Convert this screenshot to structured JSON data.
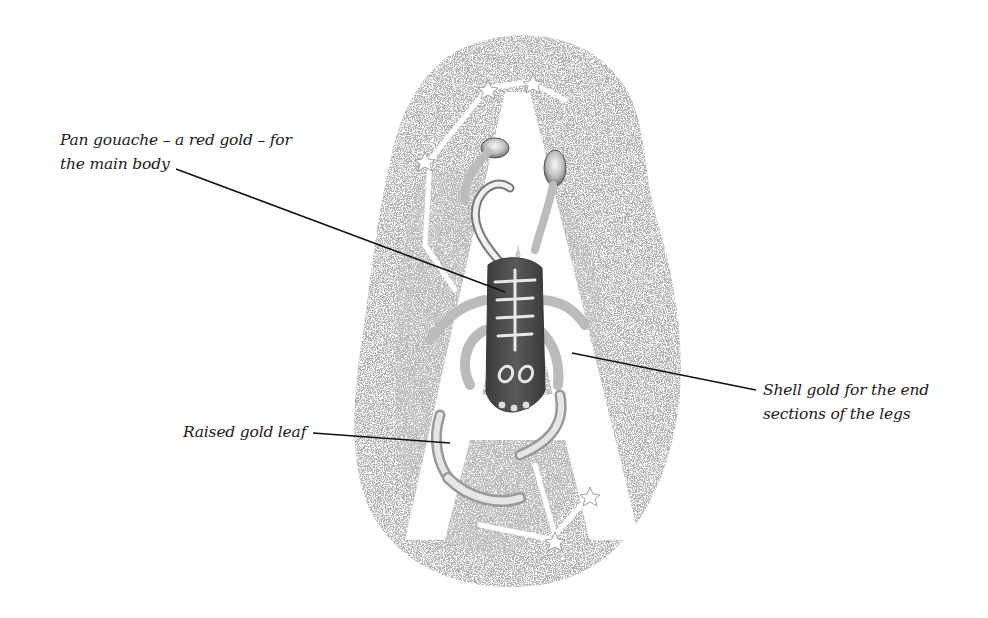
{
  "illustration": {
    "subject": "Illuminated letter A with raised gilded scorpion and constellation stars",
    "letter": "A",
    "colors": {
      "background": "#ffffff",
      "speckle": "#9a9a9a",
      "speckle_dark": "#6e6e6e",
      "body": "#4a4a4a",
      "highlight": "#f2f2f2",
      "leader_line": "#111111"
    }
  },
  "annotations": [
    {
      "id": "main-body",
      "lines": [
        "Pan gouache – a red gold – for",
        "the main body"
      ]
    },
    {
      "id": "leg-ends",
      "lines": [
        "Shell gold for the end",
        "sections of the legs"
      ]
    },
    {
      "id": "raised-leaf",
      "lines": [
        "Raised gold leaf"
      ]
    }
  ]
}
